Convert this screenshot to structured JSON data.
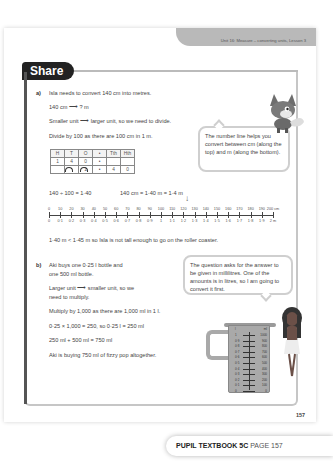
{
  "header": {
    "unit_label": "Unit 16: Measure – converting units, Lesson 3"
  },
  "section": {
    "title": "Share"
  },
  "part_a": {
    "label": "a)",
    "lines": [
      "Isla needs to convert 140 cm into metres.",
      "140 cm ⟶ ? m",
      "Smaller unit ⟶ larger unit, so we need to divide.",
      "Divide by 100 as there are 100 cm in 1 m."
    ],
    "place_value_table": {
      "headers": [
        "H",
        "T",
        "O",
        "•",
        "Tth",
        "Hth"
      ],
      "rows": [
        [
          "1",
          "4",
          "0",
          "•",
          "",
          ""
        ],
        [
          "",
          "",
          "1",
          "•",
          "4",
          "0"
        ]
      ]
    },
    "calc_1": "140 ÷ 100 = 1·40",
    "calc_2": "140 cm = 1·40 m = 1·4 m",
    "number_line": {
      "top_labels": [
        "0",
        "10",
        "20",
        "30",
        "40",
        "50",
        "60",
        "70",
        "80",
        "90",
        "100",
        "110",
        "120",
        "130",
        "140",
        "150",
        "160",
        "170",
        "180",
        "190",
        "200 cm"
      ],
      "bottom_labels": [
        "0",
        "0·1",
        "0·2",
        "0·3",
        "0·4",
        "0·5",
        "0·6",
        "0·7",
        "0·8",
        "0·9",
        "1",
        "1·1",
        "1·2",
        "1·3",
        "1·4",
        "1·5",
        "1·6",
        "1·7",
        "1·8",
        "1·9",
        "2 m"
      ],
      "arrow_symbol": "↓",
      "arrow_at": "140"
    },
    "conclusion": "1·40 m < 1·45 m so Isla is not tall enough to go on the roller coaster.",
    "bubble": "The number line helps you convert between cm (along the top) and m (along the bottom)."
  },
  "part_b": {
    "label": "b)",
    "lines": [
      "Aki buys one 0·25 l bottle and",
      "one 500 ml bottle.",
      "Larger unit ⟶ smaller unit, so we",
      "need to multiply.",
      "Multiply by 1,000 as there are 1,000 ml in 1 l.",
      "0·25 × 1,000 = 250, so 0·25 l = 250 ml",
      "250 ml + 500 ml = 750 ml",
      "Aki is buying 750 ml of fizzy pop altogether."
    ],
    "bubble": "The question asks for the answer to be given in millilitres. One of the amounts is in litres, so I am going to convert it first.",
    "jug": {
      "header_l": "l",
      "header_ml": "ml",
      "l_labels": [
        "1",
        "0·9",
        "0·8",
        "0·7",
        "0·6",
        "0·5",
        "0·4",
        "0·3",
        "0·2",
        "0·1",
        "0"
      ],
      "ml_labels": [
        "1000",
        "900",
        "800",
        "700",
        "600",
        "500",
        "400",
        "300",
        "200",
        "100",
        "0"
      ]
    }
  },
  "footer": {
    "page_number": "157",
    "book": "PUPIL TEXTBOOK 5C",
    "page_label": "PAGE 157"
  },
  "colors": {
    "tab_grey": "#b9b9b9",
    "badge_black": "#222222",
    "bubble_border": "#cfcfcf",
    "jug_grey": "#a9a9a9"
  }
}
